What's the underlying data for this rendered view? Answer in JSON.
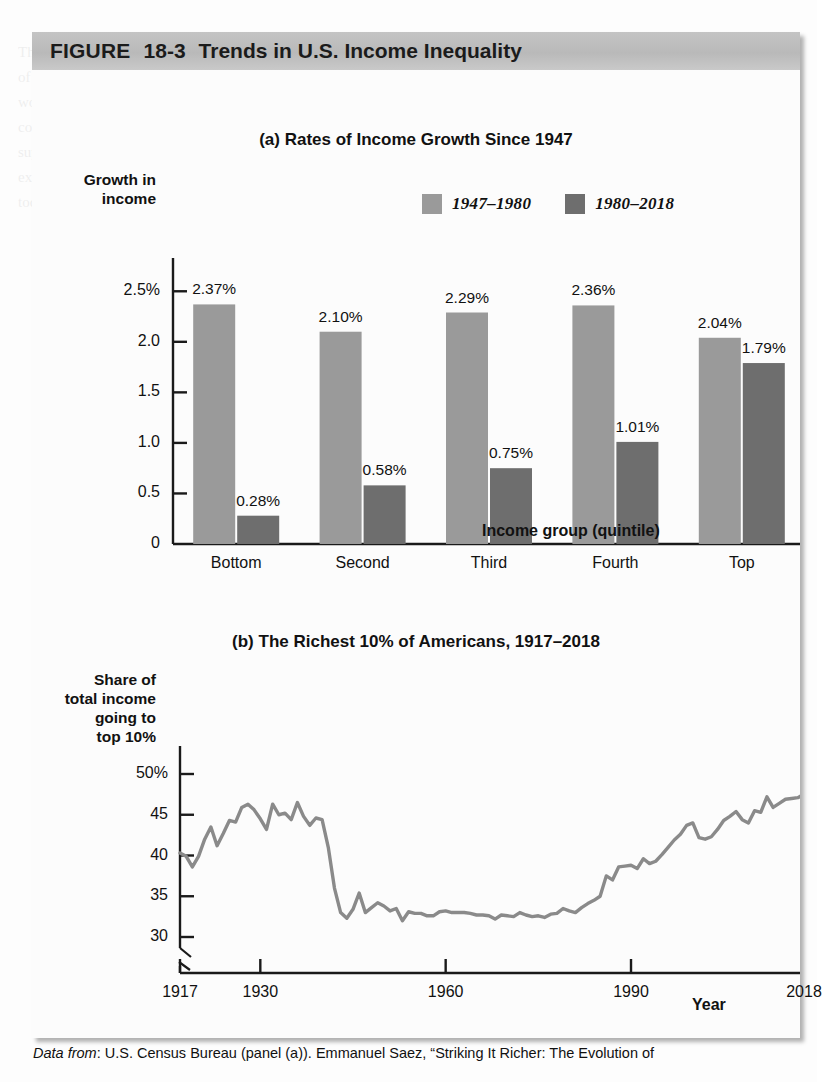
{
  "figure": {
    "label": "FIGURE",
    "number": "18-3",
    "title": "Trends in U.S. Income Inequality",
    "header_bg": "#bebebe"
  },
  "colors": {
    "series_light": "#9a9a9a",
    "series_dark": "#6e6e6e",
    "line": "#8a8a8a",
    "axis": "#1a1a1a",
    "page_bg": "#fdfdfd"
  },
  "panel_a": {
    "title": "(a) Rates of Income Growth Since 1947",
    "ylabel_line1": "Growth in",
    "ylabel_line2": "income",
    "xaxis_title": "Income group (quintile)",
    "legend": [
      {
        "label": "1947–1980",
        "color": "#9a9a9a"
      },
      {
        "label": "1980–2018",
        "color": "#6e6e6e"
      }
    ]
  },
  "panel_b": {
    "title": "(b) The Richest 10% of Americans, 1917–2018",
    "ylabel_line1": "Share of",
    "ylabel_line2": "total income",
    "ylabel_line3": "going to",
    "ylabel_line4": "top 10%",
    "xaxis_title": "Year"
  },
  "caption": {
    "prefix": "Data from",
    "text": ": U.S. Census Bureau (panel (a)). Emmanuel Saez, “Striking It Richer: The Evolution of"
  },
  "bleed_text": "The demand for labor, like the demand for any factor, is a derived demand. Firms hire workers because of the value of the output they produce. The marginal product of labor is the additional output a firm gets from hiring one more worker. The value of the marginal product is the marginal product multiplied by the price of the good. In a perfectly competitive labor market the equilibrium wage equals the value of the marginal product of labor. Changes in the supply of labor and in the demand for labor shift the market equilibrium wage. Human capital and differences in skill explain a large part of observed wage differences across workers and across occupations in the United States economy today.",
  "chart_data": [
    {
      "type": "bar",
      "title": "(a) Rates of Income Growth Since 1947",
      "xlabel": "Income group (quintile)",
      "ylabel": "Growth in income",
      "categories": [
        "Bottom",
        "Second",
        "Third",
        "Fourth",
        "Top"
      ],
      "ylim": [
        0,
        2.75
      ],
      "yticks": [
        0,
        0.5,
        1.0,
        1.5,
        2.0,
        2.5
      ],
      "ytick_labels": [
        "0",
        "0.5",
        "1.0",
        "1.5",
        "2.0",
        "2.5%"
      ],
      "grid": false,
      "legend_position": "top-right",
      "series": [
        {
          "name": "1947–1980",
          "color": "#9a9a9a",
          "values": [
            2.37,
            2.1,
            2.29,
            2.36,
            2.04
          ],
          "labels": [
            "2.37%",
            "2.10%",
            "2.29%",
            "2.36%",
            "2.04%"
          ]
        },
        {
          "name": "1980–2018",
          "color": "#6e6e6e",
          "values": [
            0.28,
            0.58,
            0.75,
            1.01,
            1.79
          ],
          "labels": [
            "0.28%",
            "0.58%",
            "0.75%",
            "1.01%",
            "1.79%"
          ]
        }
      ]
    },
    {
      "type": "line",
      "title": "(b) The Richest 10% of Americans, 1917–2018",
      "xlabel": "Year",
      "ylabel": "Share of total income going to top 10%",
      "xlim": [
        1917,
        2018
      ],
      "xticks": [
        1917,
        1930,
        1960,
        1990,
        2018
      ],
      "xtick_labels": [
        "1917",
        "1930",
        "1960",
        "1990",
        "2018"
      ],
      "ylim": [
        28.5,
        51.5
      ],
      "yticks": [
        30,
        35,
        40,
        45,
        50
      ],
      "ytick_labels": [
        "30",
        "35",
        "40",
        "45",
        "50%"
      ],
      "y_axis_break": true,
      "grid": false,
      "series_name": "Share of total income going to top 10%",
      "color": "#8a8a8a",
      "x": [
        1917,
        1918,
        1919,
        1920,
        1921,
        1922,
        1923,
        1924,
        1925,
        1926,
        1927,
        1928,
        1929,
        1930,
        1931,
        1932,
        1933,
        1934,
        1935,
        1936,
        1937,
        1938,
        1939,
        1940,
        1941,
        1942,
        1943,
        1944,
        1945,
        1946,
        1947,
        1948,
        1949,
        1950,
        1951,
        1952,
        1953,
        1954,
        1955,
        1956,
        1957,
        1958,
        1959,
        1960,
        1961,
        1962,
        1963,
        1964,
        1965,
        1966,
        1967,
        1968,
        1969,
        1970,
        1971,
        1972,
        1973,
        1974,
        1975,
        1976,
        1977,
        1978,
        1979,
        1980,
        1981,
        1982,
        1983,
        1984,
        1985,
        1986,
        1987,
        1988,
        1989,
        1990,
        1991,
        1992,
        1993,
        1994,
        1995,
        1996,
        1997,
        1998,
        1999,
        2000,
        2001,
        2002,
        2003,
        2004,
        2005,
        2006,
        2007,
        2008,
        2009,
        2010,
        2011,
        2012,
        2013,
        2014,
        2015,
        2016,
        2017,
        2018
      ],
      "y": [
        40.3,
        39.9,
        38.6,
        39.9,
        42.0,
        43.5,
        41.2,
        42.7,
        44.3,
        44.1,
        45.9,
        46.3,
        45.6,
        44.5,
        43.2,
        46.3,
        45.0,
        45.2,
        44.4,
        46.5,
        44.8,
        43.7,
        44.6,
        44.4,
        41.0,
        36.0,
        33.0,
        32.3,
        33.4,
        35.4,
        33.0,
        33.6,
        34.2,
        33.8,
        33.2,
        33.5,
        32.0,
        33.1,
        32.9,
        32.9,
        32.6,
        32.6,
        33.1,
        33.2,
        33.0,
        33.0,
        33.0,
        32.9,
        32.7,
        32.7,
        32.6,
        32.2,
        32.7,
        32.6,
        32.5,
        33.0,
        32.7,
        32.5,
        32.6,
        32.4,
        32.8,
        32.9,
        33.5,
        33.2,
        33.0,
        33.6,
        34.1,
        34.5,
        35.0,
        37.5,
        37.0,
        38.6,
        38.7,
        38.8,
        38.4,
        39.6,
        39.0,
        39.3,
        40.1,
        41.0,
        41.9,
        42.6,
        43.7,
        44.0,
        42.2,
        42.0,
        42.3,
        43.2,
        44.3,
        44.8,
        45.4,
        44.4,
        44.0,
        45.5,
        45.3,
        47.2,
        45.9,
        46.4,
        46.9,
        47.0,
        47.1,
        47.5
      ]
    }
  ]
}
